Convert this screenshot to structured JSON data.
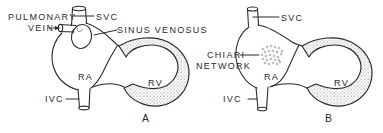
{
  "figure": {
    "colors": {
      "line": "#2b2b2b",
      "text": "#2b2b2b",
      "stipple_dot": "#b5b5b5",
      "chiari_dot": "#8f8f8f",
      "background": "#ffffff"
    },
    "panels": [
      {
        "panel_label": "A",
        "labels": {
          "pulmonary_vein_line1": "PULMONARY",
          "pulmonary_vein_line2": "VEIN",
          "svc": "SVC",
          "sinus_venosus": "SINUS VENOSUS",
          "ra": "RA",
          "rv": "RV",
          "ivc": "IVC"
        }
      },
      {
        "panel_label": "B",
        "labels": {
          "svc": "SVC",
          "chiari_line1": "CHIARI",
          "chiari_line2": "NETWORK",
          "ra": "RA",
          "rv": "RV",
          "ivc": "IVC"
        }
      }
    ]
  }
}
